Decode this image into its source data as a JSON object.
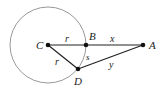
{
  "diagram": {
    "type": "geometry",
    "circle": {
      "center": "C",
      "radius_label": "r",
      "stroke": "#999999"
    },
    "points": {
      "C": {
        "label": "C",
        "x": 48,
        "y": 45
      },
      "B": {
        "label": "B",
        "x": 86,
        "y": 45
      },
      "A": {
        "label": "A",
        "x": 143,
        "y": 45
      },
      "D": {
        "label": "D",
        "x": 78,
        "y": 69
      }
    },
    "segments": [
      {
        "from": "C",
        "to": "B",
        "label": "r"
      },
      {
        "from": "B",
        "to": "A",
        "label": "x"
      },
      {
        "from": "C",
        "to": "D",
        "label": "r"
      },
      {
        "from": "D",
        "to": "A",
        "label": "y"
      }
    ],
    "arc": {
      "from": "B",
      "to": "D",
      "label": "s"
    },
    "colors": {
      "line": "#222222",
      "circle": "#999999",
      "point": "#111111"
    }
  }
}
